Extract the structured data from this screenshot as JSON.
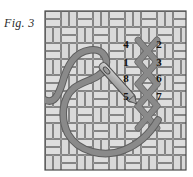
{
  "figure": {
    "caption": "Fig. 3"
  },
  "colors": {
    "background": "#ffffff",
    "canvas_fill": "#e6e6e6",
    "canvas_weave_fill": "#dcdcdc",
    "canvas_outline": "#5a5a5a",
    "canvas_border": "#4a4a4a",
    "thread": "#8a8a8a",
    "thread_outline": "#5e5e5e",
    "needle_fill": "#b9b9b9",
    "needle_outline": "#4f4f4f",
    "number_color": "#14110f"
  },
  "canvas": {
    "x": 45,
    "y": 11,
    "width": 141,
    "height": 159,
    "weave_cell": 16,
    "weave_pattern": "basket-weave"
  },
  "numbers": {
    "left_column": [
      {
        "label": "4",
        "x": 126,
        "y": 48
      },
      {
        "label": "1",
        "x": 126,
        "y": 66
      },
      {
        "label": "8",
        "x": 126,
        "y": 82
      },
      {
        "label": "5",
        "x": 126,
        "y": 100
      }
    ],
    "right_column": [
      {
        "label": "2",
        "x": 159,
        "y": 48
      },
      {
        "label": "3",
        "x": 159,
        "y": 66
      },
      {
        "label": "6",
        "x": 159,
        "y": 82
      },
      {
        "label": "7",
        "x": 159,
        "y": 100
      }
    ]
  },
  "stitches": {
    "type": "cross-stitch-column",
    "count": 4,
    "column_x_left": 138,
    "column_x_right": 156,
    "top_y": 40,
    "step": 22
  },
  "needle": {
    "from_x": 103,
    "from_y": 67,
    "to_x": 140,
    "to_y": 108,
    "eye_position": "head-upper-left"
  },
  "thread": {
    "shape": "s-loop",
    "exit_edge": "left",
    "exit_y": 100
  }
}
